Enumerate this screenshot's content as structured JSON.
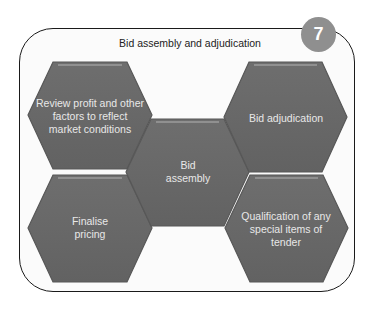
{
  "diagram": {
    "title": "Bid assembly and adjudication",
    "step_number": "7",
    "colors": {
      "hex_fill": "#6a6a6a",
      "hex_edge": "#555555",
      "hex_highlight": "#9a9a9a",
      "badge": "#8f8f8f",
      "frame_border": "#1a1a1a",
      "label_text": "#e8e8e8"
    },
    "hexagons": [
      {
        "id": "review",
        "label": "Review profit and other factors to reflect market conditions",
        "position": "top-left"
      },
      {
        "id": "adjudication",
        "label": "Bid adjudication",
        "position": "top-right"
      },
      {
        "id": "assembly",
        "label": "Bid assembly",
        "position": "center"
      },
      {
        "id": "pricing",
        "label": "Finalise pricing",
        "position": "bottom-left"
      },
      {
        "id": "qualification",
        "label": "Qualification of any special items of tender",
        "position": "bottom-right"
      }
    ]
  }
}
